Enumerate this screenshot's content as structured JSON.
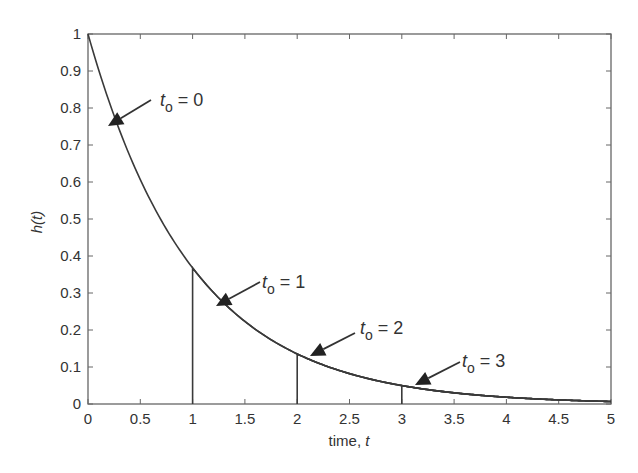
{
  "chart_data": {
    "type": "line",
    "title": "",
    "xlabel": "time, t",
    "xlabel_prefix": "time, ",
    "xlabel_var": "t",
    "ylabel": "h(t)",
    "xlim": [
      0,
      5
    ],
    "ylim": [
      0,
      1
    ],
    "grid": false,
    "legend": null,
    "x_ticks": [
      0,
      0.5,
      1,
      1.5,
      2,
      2.5,
      3,
      3.5,
      4,
      4.5,
      5
    ],
    "x_tick_labels": [
      "0",
      "0.5",
      "1",
      "1.5",
      "2",
      "2.5",
      "3",
      "3.5",
      "4",
      "4.5",
      "5"
    ],
    "y_ticks": [
      0,
      0.1,
      0.2,
      0.3,
      0.4,
      0.5,
      0.6,
      0.7,
      0.8,
      0.9,
      1
    ],
    "y_tick_labels": [
      "0",
      "0.1",
      "0.2",
      "0.3",
      "0.4",
      "0.5",
      "0.6",
      "0.7",
      "0.8",
      "0.9",
      "1"
    ],
    "function": "h(t) = exp(-t) for t >= t0, 0 otherwise",
    "series": [
      {
        "name": "t0 = 0",
        "t0": 0,
        "peak": 1.0,
        "x": [
          0,
          0.5,
          1,
          1.5,
          2,
          2.5,
          3,
          3.5,
          4,
          4.5,
          5
        ],
        "values": [
          1.0,
          0.607,
          0.368,
          0.223,
          0.135,
          0.082,
          0.05,
          0.03,
          0.018,
          0.011,
          0.007
        ]
      },
      {
        "name": "t0 = 1",
        "t0": 1,
        "peak": 0.368,
        "x": [
          1,
          1.5,
          2,
          2.5,
          3,
          3.5,
          4,
          4.5,
          5
        ],
        "values": [
          0.368,
          0.223,
          0.135,
          0.082,
          0.05,
          0.03,
          0.018,
          0.011,
          0.007
        ]
      },
      {
        "name": "t0 = 2",
        "t0": 2,
        "peak": 0.135,
        "x": [
          2,
          2.5,
          3,
          3.5,
          4,
          4.5,
          5
        ],
        "values": [
          0.135,
          0.082,
          0.05,
          0.03,
          0.018,
          0.011,
          0.007
        ]
      },
      {
        "name": "t0 = 3",
        "t0": 3,
        "peak": 0.05,
        "x": [
          3,
          3.5,
          4,
          4.5,
          5
        ],
        "values": [
          0.05,
          0.03,
          0.018,
          0.011,
          0.007
        ]
      }
    ],
    "annotations": [
      {
        "var": "t",
        "sub": "o",
        "rest": " = 0",
        "text_xy": [
          160,
          106
        ],
        "arrow_from": [
          151,
          100
        ],
        "arrow_to": [
          108,
          126
        ]
      },
      {
        "var": "t",
        "sub": "o",
        "rest": " = 1",
        "text_xy": [
          262,
          288
        ],
        "arrow_from": [
          260,
          282
        ],
        "arrow_to": [
          216,
          306
        ]
      },
      {
        "var": "t",
        "sub": "o",
        "rest": " = 2",
        "text_xy": [
          360,
          334
        ],
        "arrow_from": [
          355,
          333
        ],
        "arrow_to": [
          310,
          356
        ]
      },
      {
        "var": "t",
        "sub": "o",
        "rest": " = 3",
        "text_xy": [
          462,
          367
        ],
        "arrow_from": [
          460,
          362
        ],
        "arrow_to": [
          415,
          385
        ]
      }
    ],
    "colors": {
      "line": "#3a3a3a",
      "axis": "#555555",
      "text": "#333333"
    }
  }
}
